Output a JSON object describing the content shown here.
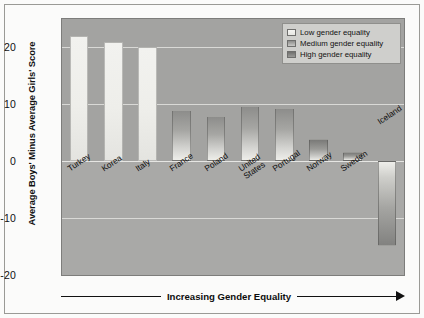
{
  "chart_data": {
    "type": "bar",
    "title": "",
    "xlabel": "Increasing Gender Equality",
    "ylabel": "Average Boys' Minus Average Girls' Score",
    "ylim": [
      -20,
      25
    ],
    "yticks": [
      "20",
      "10",
      "0",
      "-10",
      "-20"
    ],
    "ytick_values": [
      20,
      10,
      0,
      -10,
      -20
    ],
    "grid": true,
    "categories": [
      "Turkey",
      "Korea",
      "Italy",
      "France",
      "Poland",
      "United States",
      "Portugal",
      "Norway",
      "Sweden",
      "Iceland"
    ],
    "values": [
      22,
      21,
      20,
      9,
      8,
      9.8,
      9.3,
      4,
      1.7,
      -15
    ],
    "groups": [
      "low",
      "low",
      "low",
      "medium",
      "medium",
      "medium",
      "medium",
      "high",
      "high",
      "high"
    ],
    "legend_position": "top-right",
    "legend": [
      {
        "key": "low",
        "label": "Low gender equality",
        "swatch": "gradient-light"
      },
      {
        "key": "medium",
        "label": "Medium gender equality",
        "swatch": "gradient-medium"
      },
      {
        "key": "high",
        "label": "High gender equality",
        "swatch": "gradient-dark"
      }
    ],
    "annotations": [
      "Increasing Gender Equality"
    ]
  },
  "bars": [
    {
      "name": "Turkey",
      "label": "Turkey",
      "value": 22,
      "group": "low"
    },
    {
      "name": "Korea",
      "label": "Korea",
      "value": 21,
      "group": "low"
    },
    {
      "name": "Italy",
      "label": "Italy",
      "value": 20,
      "group": "low"
    },
    {
      "name": "France",
      "label": "France",
      "value": 9,
      "group": "medium"
    },
    {
      "name": "Poland",
      "label": "Poland",
      "value": 8,
      "group": "medium"
    },
    {
      "name": "United States",
      "label_line1": "United",
      "label_line2": "States",
      "value": 9.8,
      "group": "medium"
    },
    {
      "name": "Portugal",
      "label": "Portugal",
      "value": 9.3,
      "group": "medium"
    },
    {
      "name": "Norway",
      "label": "Norway",
      "value": 4,
      "group": "high"
    },
    {
      "name": "Sweden",
      "label": "Sweden",
      "value": 1.7,
      "group": "high"
    },
    {
      "name": "Iceland",
      "label": "Iceland",
      "value": -15,
      "group": "high"
    }
  ],
  "axis": {
    "y_title": "Average Boys' Minus Average Girls' Score",
    "tick_20": "20",
    "tick_10": "10",
    "tick_0": "0",
    "tick_neg10": "-10",
    "tick_neg20": "-20",
    "x_note": "Increasing Gender Equality"
  },
  "legend": {
    "low": "Low gender equality",
    "medium": "Medium gender equality",
    "high": "High gender equality"
  },
  "colors": {
    "panel_background": "#a3a3a1",
    "panel_background_lower": "#a9a9a7",
    "gridline": "#d9d9d6",
    "frame": "#9a9a96",
    "page_background": "#fbfbfa",
    "bar_low": "#eeeeea",
    "bar_medium": "#a6a6a3",
    "bar_high": "#9a9a97",
    "legend_background": "#cfcfcc",
    "text": "#111111"
  }
}
